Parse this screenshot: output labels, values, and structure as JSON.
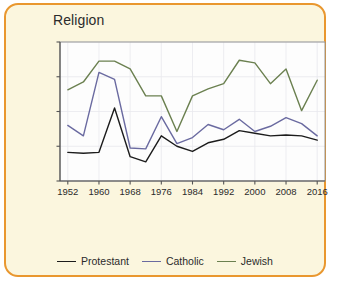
{
  "card": {
    "border_color": "#e9972f",
    "background_color": "#fbf6de"
  },
  "chart_data": {
    "type": "line",
    "title": "Religion",
    "xlabel": "",
    "ylabel": "Percent",
    "xlim": [
      1950,
      2018
    ],
    "ylim": [
      20,
      100
    ],
    "xticks": [
      1952,
      1960,
      1968,
      1976,
      1984,
      1992,
      2000,
      2008,
      2016
    ],
    "yticks": [
      20,
      40,
      60,
      80,
      100
    ],
    "grid": true,
    "legend_position": "bottom",
    "x": [
      1952,
      1956,
      1960,
      1964,
      1968,
      1972,
      1976,
      1980,
      1984,
      1988,
      1992,
      1996,
      2000,
      2004,
      2008,
      2012,
      2016
    ],
    "series": [
      {
        "name": "Protestant",
        "color": "#1c1c1c",
        "values": [
          36.5,
          36,
          36.5,
          62,
          34,
          31,
          46,
          40,
          37,
          42,
          44,
          49,
          47.5,
          46,
          46.5,
          46,
          43.5
        ]
      },
      {
        "name": "Catholic",
        "color": "#6a6aa0",
        "values": [
          52,
          46,
          82.5,
          78.5,
          39,
          38.5,
          57,
          41.5,
          45,
          52.5,
          49.5,
          55.5,
          48.5,
          51.5,
          56.5,
          53,
          46
        ]
      },
      {
        "name": "Jewish",
        "color": "#6b8050",
        "values": [
          72.5,
          77,
          89,
          89,
          84.5,
          69,
          69,
          48.5,
          69,
          73,
          76,
          89.5,
          88,
          76,
          84.5,
          60.5,
          78
        ]
      }
    ]
  },
  "legend": {
    "items": [
      {
        "label": "Protestant",
        "color": "#1c1c1c"
      },
      {
        "label": "Catholic",
        "color": "#6a6aa0"
      },
      {
        "label": "Jewish",
        "color": "#6b8050"
      }
    ]
  }
}
